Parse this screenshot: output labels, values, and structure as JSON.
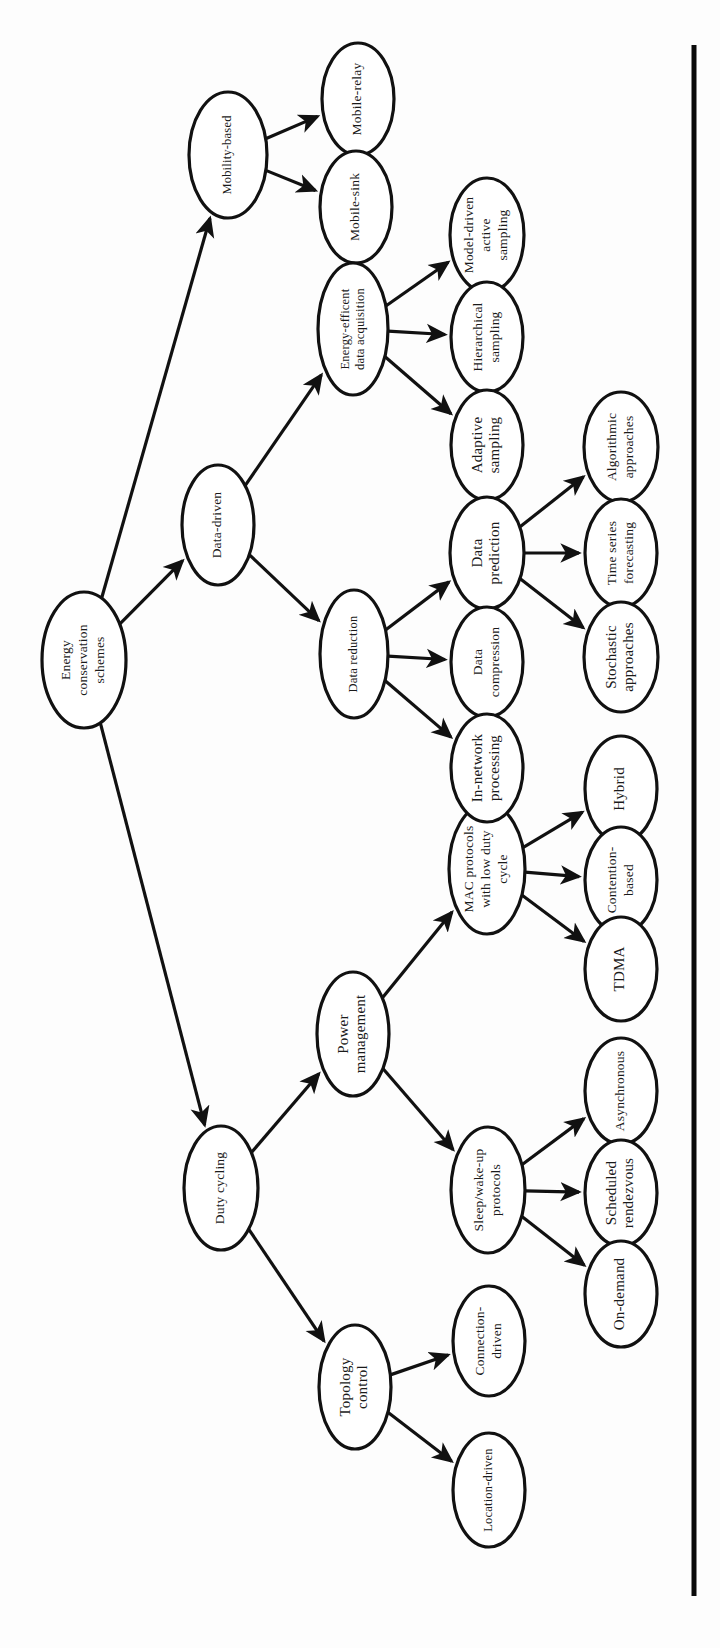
{
  "figure": {
    "orientation": "rotated-90-ccw",
    "background_color": "#fdfdfd",
    "node_fill": "#ffffff",
    "node_stroke": "#111111",
    "text_color": "#1a1a1a",
    "rule_color": "#0a0a0a"
  },
  "chart_data": {
    "type": "diagram",
    "diagram_type": "tree",
    "root": "n_root",
    "nodes": [
      {
        "id": "n_root",
        "label": "Energy conservation schemes",
        "lines": [
          "Energy",
          "conservation",
          "schemes"
        ],
        "cx": 84,
        "cy": 660,
        "rx": 42,
        "ry": 68,
        "level": 0
      },
      {
        "id": "n_mobility",
        "label": "Mobility-based",
        "lines": [
          "Mobility-based"
        ],
        "cx": 228,
        "cy": 155,
        "rx": 39,
        "ry": 63,
        "level": 1
      },
      {
        "id": "n_datadriven",
        "label": "Data-driven",
        "lines": [
          "Data-driven"
        ],
        "cx": 218,
        "cy": 525,
        "rx": 36,
        "ry": 60,
        "level": 1
      },
      {
        "id": "n_duty",
        "label": "Duty cycling",
        "lines": [
          "Duty cycling"
        ],
        "cx": 221,
        "cy": 1188,
        "rx": 37,
        "ry": 62,
        "level": 1
      },
      {
        "id": "n_mrelay",
        "label": "Mobile-relay",
        "lines": [
          "Mobile-relay"
        ],
        "cx": 358,
        "cy": 99,
        "rx": 36,
        "ry": 56,
        "level": 2
      },
      {
        "id": "n_msink",
        "label": "Mobile-sink",
        "lines": [
          "Mobile-sink"
        ],
        "cx": 356,
        "cy": 207,
        "rx": 36,
        "ry": 56,
        "level": 2
      },
      {
        "id": "n_eeda",
        "label": "Energy-efficent data acquisition",
        "lines": [
          "Energy-efficent",
          "data acquisition"
        ],
        "cx": 353,
        "cy": 329,
        "rx": 35,
        "ry": 66,
        "level": 2
      },
      {
        "id": "n_dred",
        "label": "Data reduction",
        "lines": [
          "Data reduction"
        ],
        "cx": 354,
        "cy": 654,
        "rx": 34,
        "ry": 64,
        "level": 2
      },
      {
        "id": "n_mac",
        "label": "MAC protocols with low duty cycle",
        "lines": [
          "MAC protocols",
          "with low duty",
          "cycle"
        ],
        "cx": 487,
        "cy": 869,
        "rx": 38,
        "ry": 65,
        "level": 2
      },
      {
        "id": "n_power",
        "label": "Power management",
        "lines": [
          "Power",
          "management"
        ],
        "cx": 353,
        "cy": 1034,
        "rx": 36,
        "ry": 62,
        "level": 2
      },
      {
        "id": "n_sleep",
        "label": "Sleep/wake-up protocols",
        "lines": [
          "Sleep/wake-up",
          "protocols"
        ],
        "cx": 488,
        "cy": 1190,
        "rx": 37,
        "ry": 63,
        "level": 2
      },
      {
        "id": "n_topo",
        "label": "Topology control",
        "lines": [
          "Topology",
          "control"
        ],
        "cx": 355,
        "cy": 1387,
        "rx": 36,
        "ry": 62,
        "level": 2
      },
      {
        "id": "n_mdas",
        "label": "Model-driven active sampling",
        "lines": [
          "Model-driven",
          "active",
          "sampling"
        ],
        "cx": 487,
        "cy": 235,
        "rx": 37,
        "ry": 57,
        "level": 3
      },
      {
        "id": "n_hier",
        "label": "Hierarchical sampling",
        "lines": [
          "Hierarchical",
          "sampling"
        ],
        "cx": 487,
        "cy": 337,
        "rx": 36,
        "ry": 55,
        "level": 3
      },
      {
        "id": "n_adapt",
        "label": "Adaptive sampling",
        "lines": [
          "Adaptive",
          "sampling"
        ],
        "cx": 487,
        "cy": 445,
        "rx": 36,
        "ry": 55,
        "level": 3
      },
      {
        "id": "n_dpred",
        "label": "Data prediction",
        "lines": [
          "Data",
          "prediction"
        ],
        "cx": 487,
        "cy": 553,
        "rx": 37,
        "ry": 56,
        "level": 3
      },
      {
        "id": "n_dcomp",
        "label": "Data compression",
        "lines": [
          "Data",
          "compression"
        ],
        "cx": 487,
        "cy": 662,
        "rx": 36,
        "ry": 55,
        "level": 3
      },
      {
        "id": "n_innet",
        "label": "In-network processing",
        "lines": [
          "In-network",
          "processing"
        ],
        "cx": 487,
        "cy": 768,
        "rx": 36,
        "ry": 54,
        "level": 3
      },
      {
        "id": "n_hybrid",
        "label": "Hybrid",
        "lines": [
          "Hybrid"
        ],
        "cx": 621,
        "cy": 789,
        "rx": 36,
        "ry": 53,
        "level": 4
      },
      {
        "id": "n_cont",
        "label": "Contention-based",
        "lines": [
          "Contention-",
          "based"
        ],
        "cx": 621,
        "cy": 880,
        "rx": 36,
        "ry": 53,
        "level": 4
      },
      {
        "id": "n_tdma",
        "label": "TDMA",
        "lines": [
          "TDMA"
        ],
        "cx": 621,
        "cy": 969,
        "rx": 36,
        "ry": 52,
        "level": 4
      },
      {
        "id": "n_async",
        "label": "Asynchronous",
        "lines": [
          "Asynchronous"
        ],
        "cx": 621,
        "cy": 1091,
        "rx": 36,
        "ry": 53,
        "level": 4
      },
      {
        "id": "n_sched",
        "label": "Scheduled rendezvous",
        "lines": [
          "Scheduled",
          "rendezvous"
        ],
        "cx": 621,
        "cy": 1193,
        "rx": 36,
        "ry": 53,
        "level": 4
      },
      {
        "id": "n_ondem",
        "label": "On-demand",
        "lines": [
          "On-demand"
        ],
        "cx": 621,
        "cy": 1294,
        "rx": 36,
        "ry": 53,
        "level": 4
      },
      {
        "id": "n_conn",
        "label": "Connection-driven",
        "lines": [
          "Connection-",
          "driven"
        ],
        "cx": 489,
        "cy": 1341,
        "rx": 36,
        "ry": 55,
        "level": 3
      },
      {
        "id": "n_loc",
        "label": "Location-driven",
        "lines": [
          "Location-driven"
        ],
        "cx": 489,
        "cy": 1490,
        "rx": 36,
        "ry": 57,
        "level": 3
      },
      {
        "id": "n_bpred1",
        "label": "Algorithmic approaches",
        "lines": [
          "Algorithmic",
          "approaches"
        ],
        "cx": 621,
        "cy": 447,
        "rx": 37,
        "ry": 55,
        "level": 4
      },
      {
        "id": "n_bpred2",
        "label": "Time series forecasting",
        "lines": [
          "Time series",
          "forecasting"
        ],
        "cx": 621,
        "cy": 553,
        "rx": 36,
        "ry": 54,
        "level": 4
      },
      {
        "id": "n_bpred3",
        "label": "Stochastic approaches",
        "lines": [
          "Stochastic",
          "approaches"
        ],
        "cx": 621,
        "cy": 657,
        "rx": 37,
        "ry": 55,
        "level": 4
      }
    ],
    "edges": [
      {
        "from": "n_root",
        "to": "n_mobility"
      },
      {
        "from": "n_root",
        "to": "n_datadriven"
      },
      {
        "from": "n_root",
        "to": "n_duty"
      },
      {
        "from": "n_mobility",
        "to": "n_mrelay"
      },
      {
        "from": "n_mobility",
        "to": "n_msink"
      },
      {
        "from": "n_datadriven",
        "to": "n_eeda"
      },
      {
        "from": "n_datadriven",
        "to": "n_dred"
      },
      {
        "from": "n_eeda",
        "to": "n_mdas"
      },
      {
        "from": "n_eeda",
        "to": "n_hier"
      },
      {
        "from": "n_eeda",
        "to": "n_adapt"
      },
      {
        "from": "n_dred",
        "to": "n_dpred"
      },
      {
        "from": "n_dred",
        "to": "n_dcomp"
      },
      {
        "from": "n_dred",
        "to": "n_innet"
      },
      {
        "from": "n_dpred",
        "to": "n_bpred1"
      },
      {
        "from": "n_dpred",
        "to": "n_bpred2"
      },
      {
        "from": "n_dpred",
        "to": "n_bpred3"
      },
      {
        "from": "n_duty",
        "to": "n_power"
      },
      {
        "from": "n_duty",
        "to": "n_topo"
      },
      {
        "from": "n_power",
        "to": "n_mac"
      },
      {
        "from": "n_power",
        "to": "n_sleep"
      },
      {
        "from": "n_mac",
        "to": "n_hybrid"
      },
      {
        "from": "n_mac",
        "to": "n_cont"
      },
      {
        "from": "n_mac",
        "to": "n_tdma"
      },
      {
        "from": "n_sleep",
        "to": "n_async"
      },
      {
        "from": "n_sleep",
        "to": "n_sched"
      },
      {
        "from": "n_sleep",
        "to": "n_ondem"
      },
      {
        "from": "n_topo",
        "to": "n_conn"
      },
      {
        "from": "n_topo",
        "to": "n_loc"
      }
    ],
    "rules": [
      {
        "id": "right-border",
        "x1": 694,
        "y1": 45,
        "x2": 694,
        "y2": 1596
      }
    ]
  }
}
